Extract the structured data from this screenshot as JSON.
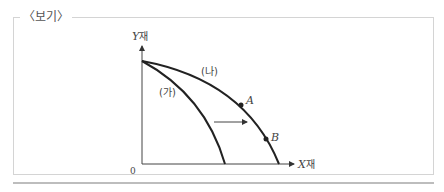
{
  "box": {
    "title": "〈보기〉"
  },
  "diagram": {
    "y_axis_label": {
      "var": "Y",
      "suffix": "재"
    },
    "x_axis_label": {
      "var": "X",
      "suffix": "재"
    },
    "origin_label": "0",
    "curves": [
      {
        "id": "ga",
        "label": "(가)"
      },
      {
        "id": "na",
        "label": "(나)"
      }
    ],
    "points": [
      {
        "id": "A",
        "label": "A"
      },
      {
        "id": "B",
        "label": "B"
      }
    ],
    "shift_arrow": "rightward shift from (가) to (나)"
  }
}
